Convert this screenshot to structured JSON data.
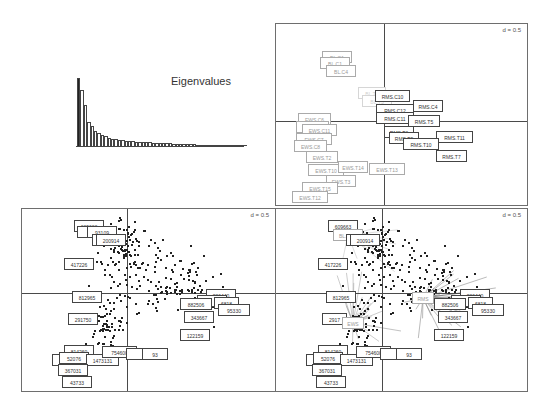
{
  "chart_data": [
    {
      "type": "bar",
      "title": "Eigenvalues",
      "panel": "top-left",
      "values": [
        100,
        82,
        60,
        35,
        29,
        22,
        19,
        16,
        15,
        12,
        11,
        10,
        9,
        8.5,
        8,
        7.5,
        7,
        6.5,
        6,
        5.8,
        5.5,
        5.2,
        5,
        4.8,
        4.5,
        4.2,
        4,
        3.8,
        3.6,
        3.4,
        3.2,
        3,
        2.8,
        2.6,
        2.4,
        2.2,
        2,
        1.8,
        1.6,
        1.4,
        1.2,
        1.0,
        0.9,
        0.8,
        0.7,
        0.6,
        0.5,
        0.4,
        0.3,
        0.2
      ],
      "note": "first eigenvalue bar highlighted in black"
    },
    {
      "type": "scatter",
      "panel": "top-right",
      "scale_label": "d = 0.5",
      "grid": false,
      "labels": [
        {
          "text": "BL.C1",
          "x": -1.7,
          "y": 1.9,
          "shade": "light"
        },
        {
          "text": "BL.C4",
          "x": -1.5,
          "y": 1.7,
          "shade": "light"
        },
        {
          "text": "BL.T1",
          "x": -0.2,
          "y": 0.9,
          "shade": "faint"
        },
        {
          "text": "RMS.C10",
          "x": 0.8,
          "y": 0.5,
          "shade": "dark"
        },
        {
          "text": "RMS.C4",
          "x": 1.5,
          "y": 0.3,
          "shade": "dark"
        },
        {
          "text": "RMS.C11",
          "x": 0.6,
          "y": 0.1,
          "shade": "dark"
        },
        {
          "text": "RMS.T5",
          "x": 1.4,
          "y": 0.05,
          "shade": "dark"
        },
        {
          "text": "RMS.T11",
          "x": 2.2,
          "y": -0.35,
          "shade": "dark"
        },
        {
          "text": "RMS.T10",
          "x": 1.3,
          "y": -0.45,
          "shade": "dark"
        },
        {
          "text": "RMS.T7",
          "x": 2.1,
          "y": -0.75,
          "shade": "dark"
        },
        {
          "text": "RMS.T3",
          "x": 0.8,
          "y": -0.3,
          "shade": "dark"
        },
        {
          "text": "EWS.C6",
          "x": -1.6,
          "y": 0.05,
          "shade": "light"
        },
        {
          "text": "EWS.C11",
          "x": -1.4,
          "y": -0.15,
          "shade": "light"
        },
        {
          "text": "EWS.C7",
          "x": -1.5,
          "y": -0.35,
          "shade": "light"
        },
        {
          "text": "EWS.C8",
          "x": -1.6,
          "y": -0.55,
          "shade": "light"
        },
        {
          "text": "EWS.T2",
          "x": -1.3,
          "y": -0.75,
          "shade": "light"
        },
        {
          "text": "EWS.T10",
          "x": -1.2,
          "y": -1.0,
          "shade": "light"
        },
        {
          "text": "EWS.T14",
          "x": -0.3,
          "y": -1.0,
          "shade": "light"
        },
        {
          "text": "EWS.T13",
          "x": 0.5,
          "y": -1.05,
          "shade": "light"
        },
        {
          "text": "EWS.T3",
          "x": -1.0,
          "y": -1.3,
          "shade": "light"
        },
        {
          "text": "EWS.T15",
          "x": -1.5,
          "y": -1.45,
          "shade": "light"
        },
        {
          "text": "EWS.T12",
          "x": -1.7,
          "y": -1.65,
          "shade": "light"
        }
      ]
    },
    {
      "type": "scatter",
      "panel": "bottom-left",
      "scale_label": "d = 0.5",
      "grid": false,
      "labels": [
        {
          "text": "609663",
          "x": -1.3,
          "y": 1.6
        },
        {
          "text": "93109",
          "x": -0.9,
          "y": 1.45
        },
        {
          "text": "200914",
          "x": -0.4,
          "y": 1.25
        },
        {
          "text": "417226",
          "x": -1.5,
          "y": 0.7
        },
        {
          "text": "812965",
          "x": -1.3,
          "y": 0.0
        },
        {
          "text": "291750",
          "x": -1.4,
          "y": -0.6
        },
        {
          "text": "814260",
          "x": -1.4,
          "y": -1.25
        },
        {
          "text": "52076",
          "x": -1.6,
          "y": -1.45
        },
        {
          "text": "1473131",
          "x": -1.0,
          "y": -1.5
        },
        {
          "text": "754600",
          "x": -0.3,
          "y": -1.35
        },
        {
          "text": "93",
          "x": 0.6,
          "y": -1.4
        },
        {
          "text": "367031",
          "x": -1.6,
          "y": -1.7
        },
        {
          "text": "43733",
          "x": -1.5,
          "y": -1.95
        },
        {
          "text": "206440",
          "x": 2.6,
          "y": 0.05
        },
        {
          "text": "6818",
          "x": 2.3,
          "y": -0.2
        },
        {
          "text": "95330",
          "x": 2.8,
          "y": -0.35
        },
        {
          "text": "882506",
          "x": 1.6,
          "y": -0.3
        },
        {
          "text": "343667",
          "x": 1.7,
          "y": -0.55
        },
        {
          "text": "122159",
          "x": 1.8,
          "y": -1.0
        }
      ],
      "points_note": "~350 individual sample points clustered around center-left"
    },
    {
      "type": "scatter",
      "panel": "bottom-right",
      "scale_label": "d = 0.5",
      "grid": false,
      "note": "Overlay of samples with group centroids (BL, RMS, EWS) and connecting star lines",
      "centroids": [
        {
          "text": "BL.RML",
          "x": -1.2,
          "y": 1.45
        },
        {
          "text": "RMS",
          "x": 0.8,
          "y": 0.0
        },
        {
          "text": "EWS",
          "x": -0.8,
          "y": -0.7
        }
      ],
      "labels": [
        "609663",
        "200914",
        "417226",
        "812965",
        "2917..",
        "814260",
        "52076",
        "1473131",
        "754600",
        "93",
        "367031",
        "43733",
        "206440",
        "6818",
        "95330",
        "882506",
        "343667",
        "122159"
      ]
    }
  ],
  "panels": {
    "eig": {
      "title": "Eigenvalues"
    },
    "tr": {
      "d": "d = 0.5"
    },
    "bl": {
      "d": "d = 0.5"
    },
    "br": {
      "d": "d = 0.5"
    }
  },
  "tr_labels": [
    {
      "t": "BL.C1",
      "x": 46,
      "y": 27,
      "w": 30,
      "c": "light"
    },
    {
      "t": "BL.C1",
      "x": 44,
      "y": 33,
      "w": 30,
      "c": "light"
    },
    {
      "t": "BL.C4",
      "x": 50,
      "y": 41,
      "w": 30,
      "c": "light"
    },
    {
      "t": "BL.T1",
      "x": 82,
      "y": 63,
      "w": 28,
      "c": "faint"
    },
    {
      "t": "BL.T3",
      "x": 86,
      "y": 71,
      "w": 30,
      "c": "faint"
    },
    {
      "t": "RMS.C10",
      "x": 99,
      "y": 66,
      "w": 35,
      "c": "dark"
    },
    {
      "t": "RMS.C4",
      "x": 137,
      "y": 76,
      "w": 30,
      "c": "dark"
    },
    {
      "t": "RMS.C12",
      "x": 100,
      "y": 80,
      "w": 38,
      "c": "dark"
    },
    {
      "t": "RMS.C11",
      "x": 100,
      "y": 88,
      "w": 38,
      "c": "dark"
    },
    {
      "t": "RMS.T5",
      "x": 132,
      "y": 91,
      "w": 32,
      "c": "dark"
    },
    {
      "t": "RMS.T6",
      "x": 108,
      "y": 102,
      "w": 30,
      "c": "dark"
    },
    {
      "t": "RMS.T9",
      "x": 113,
      "y": 108,
      "w": 30,
      "c": "dark"
    },
    {
      "t": "RMS.T11",
      "x": 160,
      "y": 107,
      "w": 37,
      "c": "dark"
    },
    {
      "t": "RMS.T10",
      "x": 127,
      "y": 114,
      "w": 36,
      "c": "dark"
    },
    {
      "t": "RMS.T7",
      "x": 160,
      "y": 126,
      "w": 31,
      "c": "dark"
    },
    {
      "t": "EWS.C6",
      "x": 22,
      "y": 89,
      "w": 33,
      "c": "light"
    },
    {
      "t": "EWS.C5",
      "x": 20,
      "y": 97,
      "w": 33,
      "c": "light"
    },
    {
      "t": "EWS.C11",
      "x": 26,
      "y": 100,
      "w": 35,
      "c": "light"
    },
    {
      "t": "EWS.C7",
      "x": 20,
      "y": 109,
      "w": 36,
      "c": "light"
    },
    {
      "t": "EWS.C8",
      "x": 18,
      "y": 116,
      "w": 33,
      "c": "light"
    },
    {
      "t": "EWS.T2",
      "x": 30,
      "y": 127,
      "w": 32,
      "c": "light"
    },
    {
      "t": "EWS.T10",
      "x": 32,
      "y": 140,
      "w": 36,
      "c": "light"
    },
    {
      "t": "EWS.T14",
      "x": 62,
      "y": 137,
      "w": 30,
      "c": "light"
    },
    {
      "t": "EWS.T13",
      "x": 93,
      "y": 139,
      "w": 36,
      "c": "light"
    },
    {
      "t": "EWS.T3",
      "x": 50,
      "y": 151,
      "w": 30,
      "c": "light"
    },
    {
      "t": "EWS.T15",
      "x": 26,
      "y": 158,
      "w": 36,
      "c": "light"
    },
    {
      "t": "EWS.T12",
      "x": 16,
      "y": 167,
      "w": 36,
      "c": "light"
    }
  ],
  "bl_labels": [
    {
      "t": "609663",
      "x": 52,
      "y": 11,
      "w": 30
    },
    {
      "t": "",
      "x": 55,
      "y": 17,
      "w": 30
    },
    {
      "t": "93109",
      "x": 65,
      "y": 17,
      "w": 30
    },
    {
      "t": "",
      "x": 70,
      "y": 25,
      "w": 30
    },
    {
      "t": "200914",
      "x": 74,
      "y": 25,
      "w": 30
    },
    {
      "t": "417226",
      "x": 42,
      "y": 49,
      "w": 30
    },
    {
      "t": "812965",
      "x": 50,
      "y": 82,
      "w": 30
    },
    {
      "t": "291750",
      "x": 46,
      "y": 104,
      "w": 30
    },
    {
      "t": "814260",
      "x": 42,
      "y": 136,
      "w": 30
    },
    {
      "t": "",
      "x": 30,
      "y": 145,
      "w": 32
    },
    {
      "t": "52076",
      "x": 37,
      "y": 143,
      "w": 30
    },
    {
      "t": "1473131",
      "x": 64,
      "y": 145,
      "w": 33
    },
    {
      "t": "754600",
      "x": 80,
      "y": 137,
      "w": 35
    },
    {
      "t": "",
      "x": 104,
      "y": 139,
      "w": 20
    },
    {
      "t": "93",
      "x": 120,
      "y": 139,
      "w": 26
    },
    {
      "t": "367031",
      "x": 36,
      "y": 155,
      "w": 30
    },
    {
      "t": "43733",
      "x": 40,
      "y": 167,
      "w": 30
    },
    {
      "t": "206440",
      "x": 184,
      "y": 80,
      "w": 30
    },
    {
      "t": "",
      "x": 175,
      "y": 86,
      "w": 30
    },
    {
      "t": "6818",
      "x": 192,
      "y": 88,
      "w": 25
    },
    {
      "t": "95330",
      "x": 196,
      "y": 95,
      "w": 32
    },
    {
      "t": "882506",
      "x": 158,
      "y": 89,
      "w": 32
    },
    {
      "t": "343667",
      "x": 162,
      "y": 102,
      "w": 30
    },
    {
      "t": "122159",
      "x": 158,
      "y": 120,
      "w": 30
    }
  ],
  "br_labels": [
    {
      "t": "609663",
      "x": 52,
      "y": 11,
      "w": 30,
      "c": "dark"
    },
    {
      "t": "BL.RML",
      "x": 57,
      "y": 20,
      "w": 30,
      "c": "light"
    },
    {
      "t": "",
      "x": 70,
      "y": 25,
      "w": 30,
      "c": "dark"
    },
    {
      "t": "200914",
      "x": 74,
      "y": 25,
      "w": 30,
      "c": "dark"
    },
    {
      "t": "417226",
      "x": 42,
      "y": 49,
      "w": 30,
      "c": "dark"
    },
    {
      "t": "812965",
      "x": 50,
      "y": 82,
      "w": 30,
      "c": "dark"
    },
    {
      "t": "2917",
      "x": 46,
      "y": 104,
      "w": 25,
      "c": "dark"
    },
    {
      "t": "EWS",
      "x": 66,
      "y": 108,
      "w": 22,
      "c": "light"
    },
    {
      "t": "814260",
      "x": 42,
      "y": 136,
      "w": 30,
      "c": "dark"
    },
    {
      "t": "",
      "x": 30,
      "y": 145,
      "w": 32,
      "c": "dark"
    },
    {
      "t": "52076",
      "x": 37,
      "y": 143,
      "w": 30,
      "c": "dark"
    },
    {
      "t": "1473131",
      "x": 64,
      "y": 145,
      "w": 33,
      "c": "dark"
    },
    {
      "t": "754600",
      "x": 80,
      "y": 137,
      "w": 35,
      "c": "dark"
    },
    {
      "t": "",
      "x": 104,
      "y": 139,
      "w": 20,
      "c": "dark"
    },
    {
      "t": "93",
      "x": 120,
      "y": 139,
      "w": 26,
      "c": "dark"
    },
    {
      "t": "367031",
      "x": 36,
      "y": 155,
      "w": 30,
      "c": "dark"
    },
    {
      "t": "43733",
      "x": 40,
      "y": 167,
      "w": 30,
      "c": "dark"
    },
    {
      "t": "RMS",
      "x": 136,
      "y": 83,
      "w": 22,
      "c": "light"
    },
    {
      "t": "206440",
      "x": 184,
      "y": 80,
      "w": 30,
      "c": "dark"
    },
    {
      "t": "",
      "x": 175,
      "y": 86,
      "w": 30,
      "c": "dark"
    },
    {
      "t": "6818",
      "x": 192,
      "y": 88,
      "w": 25,
      "c": "dark"
    },
    {
      "t": "95330",
      "x": 196,
      "y": 95,
      "w": 32,
      "c": "dark"
    },
    {
      "t": "882506",
      "x": 158,
      "y": 89,
      "w": 32,
      "c": "dark"
    },
    {
      "t": "343667",
      "x": 162,
      "y": 102,
      "w": 30,
      "c": "dark"
    },
    {
      "t": "122159",
      "x": 158,
      "y": 120,
      "w": 30,
      "c": "dark"
    }
  ]
}
